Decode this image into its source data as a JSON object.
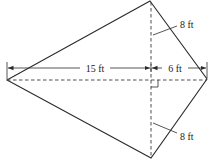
{
  "figure": {
    "shape": "kite",
    "vertices": {
      "top": [
        150,
        1
      ],
      "left": [
        7,
        80
      ],
      "right": [
        207,
        79
      ],
      "bottom": [
        151,
        158
      ]
    },
    "diagonals": {
      "horizontal": {
        "from": [
          7,
          80
        ],
        "to": [
          207,
          80
        ],
        "style": "dashed"
      },
      "vertical": {
        "from": [
          151,
          1
        ],
        "to": [
          151,
          158
        ],
        "style": "dashed"
      }
    },
    "right_angle_marker": {
      "x": 151,
      "y": 80,
      "size": 7
    }
  },
  "labels": {
    "left_segment": "15 ft",
    "right_segment": "6 ft",
    "upper_segment": "8 ft",
    "lower_segment": "8 ft"
  },
  "colors": {
    "line": "#2b2b2b",
    "text": "#222222",
    "background": "#ffffff"
  }
}
